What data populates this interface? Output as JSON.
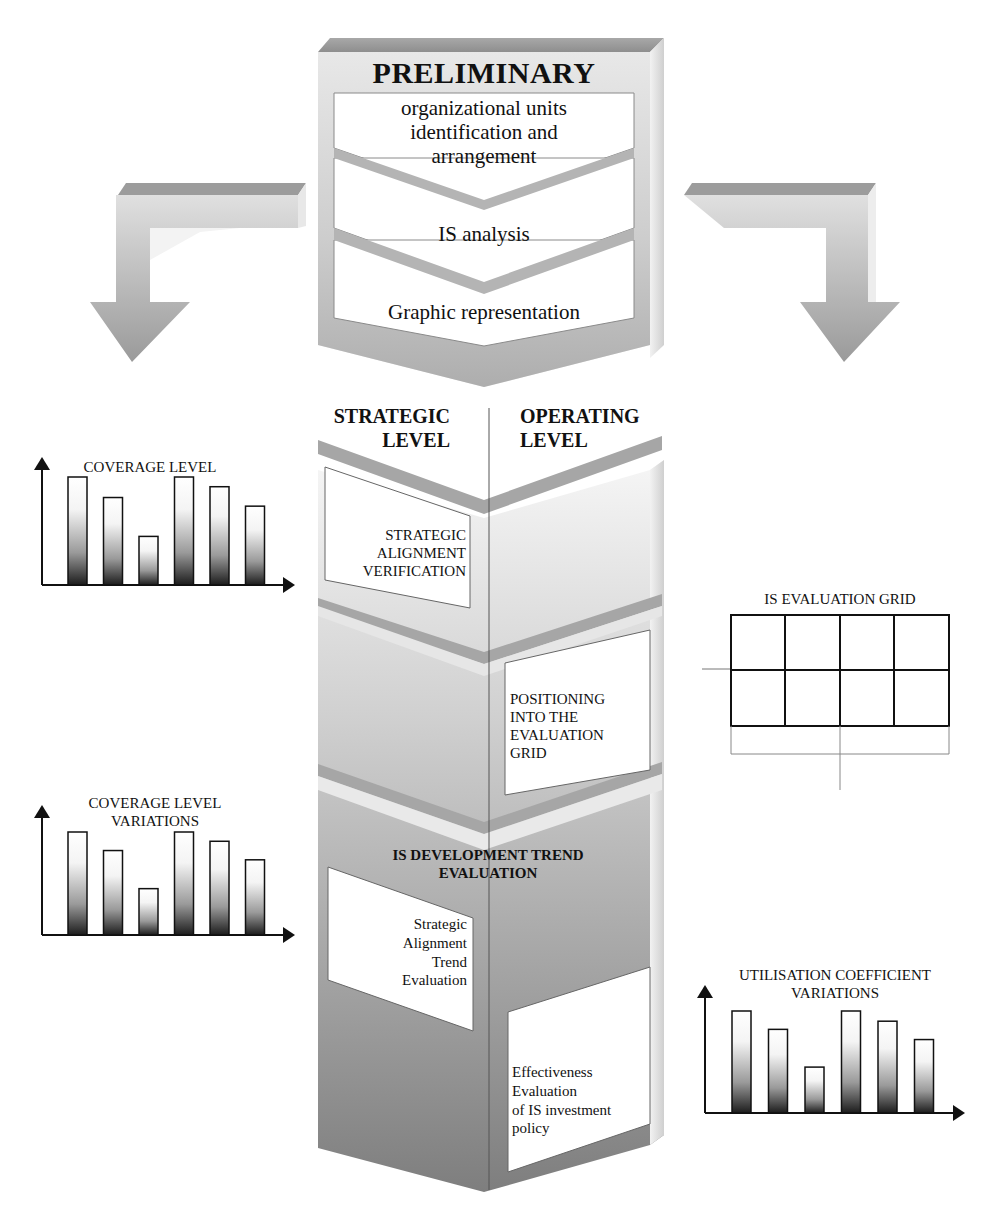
{
  "preliminary": {
    "title": "PRELIMINARY",
    "steps": [
      {
        "line1": "organizational units",
        "line2": "identification and",
        "line3": "arrangement"
      },
      {
        "label": "IS analysis"
      },
      {
        "label": "Graphic representation"
      }
    ]
  },
  "levels": {
    "strategic": {
      "line1": "STRATEGIC",
      "line2": "LEVEL"
    },
    "operating": {
      "line1": "OPERATING",
      "line2": "LEVEL"
    }
  },
  "stages": {
    "strategic_alignment": {
      "line1": "STRATEGIC",
      "line2": "ALIGNMENT",
      "line3": "VERIFICATION"
    },
    "positioning": {
      "line1": "POSITIONING",
      "line2": "INTO THE",
      "line3": "EVALUATION",
      "line4": "GRID"
    },
    "trend": {
      "title_line1": "IS DEVELOPMENT TREND",
      "title_line2": "EVALUATION",
      "left": {
        "line1": "Strategic",
        "line2": "Alignment",
        "line3": "Trend",
        "line4": "Evaluation"
      },
      "right": {
        "line1": "Effectiveness",
        "line2": "Evaluation",
        "line3": "of IS investment",
        "line4": "policy"
      }
    }
  },
  "evaluation_grid": {
    "title": "IS EVALUATION GRID",
    "rows": 2,
    "cols": 4
  },
  "colors": {
    "band": "#9a9a9a",
    "band_light": "#d6d6d6",
    "column_light": "#eeeeee",
    "column_dark": "#8c8c8c",
    "box": "#ffffff",
    "ink": "#111111"
  },
  "chart_data": [
    {
      "type": "bar",
      "title": "COVERAGE LEVEL",
      "categories": [
        "1",
        "2",
        "3",
        "4",
        "5",
        "6"
      ],
      "values": [
        100,
        81,
        45,
        100,
        91,
        73
      ],
      "xlabel": "",
      "ylabel": "",
      "ylim": [
        0,
        115
      ],
      "grid": false,
      "legend": null
    },
    {
      "type": "bar",
      "title": "COVERAGE LEVEL VARIATIONS",
      "categories": [
        "1",
        "2",
        "3",
        "4",
        "5",
        "6"
      ],
      "values": [
        100,
        82,
        45,
        100,
        91,
        73
      ],
      "xlabel": "",
      "ylabel": "",
      "ylim": [
        0,
        115
      ],
      "grid": false,
      "legend": null
    },
    {
      "type": "bar",
      "title": "UTILISATION COEFFICIENT VARIATIONS",
      "categories": [
        "1",
        "2",
        "3",
        "4",
        "5",
        "6"
      ],
      "values": [
        100,
        82,
        45,
        100,
        90,
        72
      ],
      "xlabel": "",
      "ylabel": "",
      "ylim": [
        0,
        115
      ],
      "grid": false,
      "legend": null
    }
  ]
}
